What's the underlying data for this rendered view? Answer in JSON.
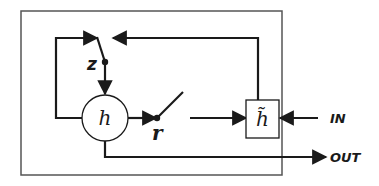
{
  "diagram": {
    "type": "GRU cell schematic",
    "nodes": {
      "hidden_state": {
        "label": "h"
      },
      "candidate_state": {
        "label": "h̃"
      },
      "update_gate": {
        "label": "z"
      },
      "reset_gate": {
        "label": "r"
      }
    },
    "io": {
      "input_label": "IN",
      "output_label": "OUT"
    },
    "colors": {
      "stroke": "#1a1a1a",
      "frame": "#555555",
      "background": "#ffffff"
    }
  }
}
